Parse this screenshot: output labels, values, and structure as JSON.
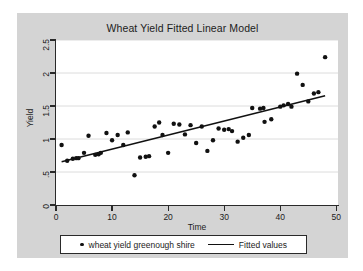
{
  "chart_data": {
    "type": "scatter",
    "title": "Wheat Yield Fitted Linear Model",
    "xlabel": "Time",
    "ylabel": "Yield",
    "xlim": [
      0,
      50.3
    ],
    "ylim": [
      0,
      2.5
    ],
    "grid": true,
    "grid_axis": "y",
    "legend_position": "bottom-outside",
    "background_color": "#d4d4d4",
    "plot_background_color": "#ffffff",
    "marker_color": "#111111",
    "line_color": "#111111",
    "grid_color": "#d8d8d8",
    "xticks": [
      0,
      10,
      20,
      30,
      40,
      50
    ],
    "xtick_labels": [
      "0",
      "10",
      "20",
      "30",
      "40",
      "50"
    ],
    "yticks": [
      0,
      0.5,
      1,
      1.5,
      2,
      2.5
    ],
    "ytick_labels": [
      "0",
      ".5",
      "1",
      "1.5",
      "2",
      "2.5"
    ],
    "series": [
      {
        "name": "wheat yield greenough shire",
        "type": "scatter",
        "marker": "filled-circle",
        "points": [
          [
            1,
            0.91
          ],
          [
            2,
            0.67
          ],
          [
            3,
            0.7
          ],
          [
            3.6,
            0.71
          ],
          [
            4,
            0.71
          ],
          [
            5,
            0.79
          ],
          [
            5.8,
            1.05
          ],
          [
            7,
            0.76
          ],
          [
            7.6,
            0.77
          ],
          [
            8,
            0.79
          ],
          [
            9,
            1.09
          ],
          [
            10,
            0.98
          ],
          [
            11,
            1.06
          ],
          [
            12,
            0.91
          ],
          [
            12.8,
            1.1
          ],
          [
            14,
            0.45
          ],
          [
            15,
            0.72
          ],
          [
            16,
            0.73
          ],
          [
            16.6,
            0.74
          ],
          [
            17.6,
            1.19
          ],
          [
            18.4,
            1.25
          ],
          [
            19,
            1.06
          ],
          [
            20,
            0.79
          ],
          [
            21,
            1.23
          ],
          [
            22,
            1.22
          ],
          [
            23,
            1.07
          ],
          [
            24,
            1.21
          ],
          [
            25,
            0.94
          ],
          [
            26,
            1.19
          ],
          [
            27,
            0.82
          ],
          [
            28,
            0.98
          ],
          [
            29,
            1.16
          ],
          [
            30,
            1.14
          ],
          [
            30.8,
            1.15
          ],
          [
            31.4,
            1.12
          ],
          [
            32.4,
            0.96
          ],
          [
            33.4,
            1.02
          ],
          [
            34.4,
            1.06
          ],
          [
            35,
            1.47
          ],
          [
            36.4,
            1.46
          ],
          [
            37,
            1.47
          ],
          [
            37.2,
            1.26
          ],
          [
            38.4,
            1.3
          ],
          [
            40,
            1.49
          ],
          [
            40.6,
            1.51
          ],
          [
            41.4,
            1.53
          ],
          [
            42,
            1.49
          ],
          [
            43,
            1.99
          ],
          [
            44,
            1.82
          ],
          [
            45,
            1.57
          ],
          [
            46,
            1.69
          ],
          [
            46.8,
            1.71
          ],
          [
            48,
            2.24
          ]
        ]
      },
      {
        "name": "Fitted values",
        "type": "line",
        "endpoints": [
          [
            1,
            0.655
          ],
          [
            48,
            1.655
          ]
        ],
        "slope": 0.02128,
        "intercept": 0.6337
      }
    ]
  },
  "legend": {
    "entries": [
      {
        "label": "wheat yield greenough shire",
        "marker": "filled-circle"
      },
      {
        "label": "Fitted values",
        "marker": "line"
      }
    ]
  }
}
